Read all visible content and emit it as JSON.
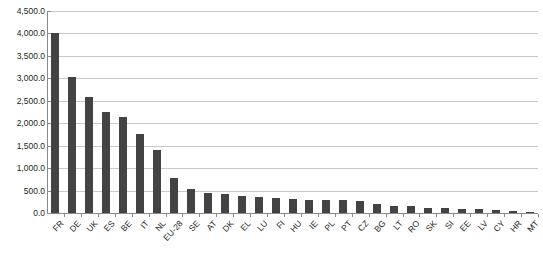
{
  "chart_data": {
    "type": "bar",
    "title": "",
    "subtitle": "",
    "xlabel": "",
    "ylabel": "",
    "legend": [],
    "grid": true,
    "ylim": [
      0,
      4500
    ],
    "ytick_step": 500,
    "ytick_labels": [
      "4,500.0",
      "4,000.0",
      "3,500.0",
      "3,000.0",
      "2,500.0",
      "2,000.0",
      "1,500.0",
      "1,000.0",
      "500.0",
      "0.0"
    ],
    "ytick_values": [
      4500,
      4000,
      3500,
      3000,
      2500,
      2000,
      1500,
      1000,
      500,
      0
    ],
    "categories": [
      "FR",
      "DE",
      "UK",
      "ES",
      "BE",
      "IT",
      "NL",
      "EU-28",
      "SE",
      "AT",
      "DK",
      "EL",
      "LU",
      "FI",
      "HU",
      "IE",
      "PL",
      "PT",
      "CZ",
      "BG",
      "LT",
      "RO",
      "SK",
      "SI",
      "EE",
      "LV",
      "CY",
      "HR",
      "MT"
    ],
    "values": [
      4000,
      3030,
      2580,
      2240,
      2150,
      1760,
      1400,
      770,
      530,
      450,
      420,
      390,
      360,
      340,
      320,
      300,
      290,
      280,
      270,
      200,
      160,
      150,
      120,
      110,
      95,
      80,
      60,
      40,
      20
    ],
    "bar_color": "#434343",
    "grid_color": "#c9c9c9",
    "axis_color": "#8a8a8a",
    "background": "#ffffff"
  }
}
